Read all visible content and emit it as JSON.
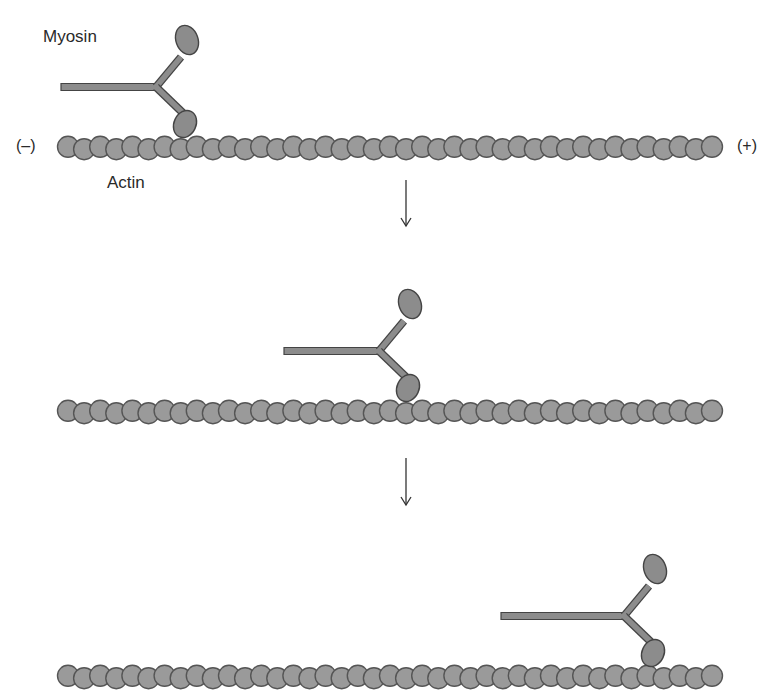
{
  "diagram": {
    "labels": {
      "myosin": "Myosin",
      "actin": "Actin",
      "minus_end": "(–)",
      "plus_end": "(+)"
    },
    "colors": {
      "bead_fill": "#9a9a9a",
      "bead_stroke": "#555555",
      "myosin_fill": "#8c8c8c",
      "myosin_stroke": "#444444",
      "arrow": "#333333"
    },
    "panels": [
      {
        "step": 1,
        "filament_y": 148,
        "filament_x_start": 68,
        "filament_x_end": 712,
        "myosin_head_x": 183
      },
      {
        "step": 2,
        "filament_y": 412,
        "filament_x_start": 68,
        "filament_x_end": 712,
        "myosin_head_x": 406
      },
      {
        "step": 3,
        "filament_y": 677,
        "filament_x_start": 68,
        "filament_x_end": 712,
        "myosin_head_x": 651
      }
    ],
    "arrows": [
      {
        "x": 406,
        "y1": 180,
        "y2": 226
      },
      {
        "x": 406,
        "y1": 458,
        "y2": 505
      }
    ]
  }
}
